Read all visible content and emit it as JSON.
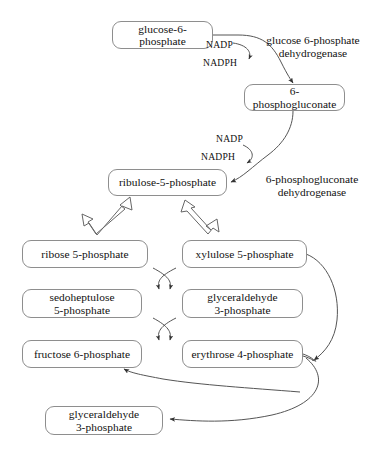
{
  "diagram": {
    "stroke_color": "#555555",
    "node_border_color": "#8e8e8e",
    "background": "#ffffff",
    "nodes": [
      {
        "id": "g6p",
        "label": "glucose-6-phosphate"
      },
      {
        "id": "pg6",
        "label": "6-phosphogluconate"
      },
      {
        "id": "ru5p",
        "label": "ribulose-5-phosphate"
      },
      {
        "id": "r5p",
        "label": "ribose 5-phosphate"
      },
      {
        "id": "xu5p",
        "label": "xylulose 5-phosphate"
      },
      {
        "id": "s7p",
        "label": "sedoheptulose\n5-phosphate"
      },
      {
        "id": "g3p_mid",
        "label": "glyceraldehyde\n3-phosphate"
      },
      {
        "id": "f6p",
        "label": "fructose 6-phosphate"
      },
      {
        "id": "e4p",
        "label": "erythrose 4-phosphate"
      },
      {
        "id": "g3p_bot",
        "label": "glyceraldehyde\n3-phosphate"
      }
    ],
    "enzymes": [
      {
        "id": "g6pdh",
        "label": "glucose 6-phosphate\ndehydrogenase"
      },
      {
        "id": "pgdh",
        "label": "6-phosphogluconate\ndehydrogenase"
      }
    ],
    "cofactors": [
      {
        "id": "nadp1",
        "label": "NADP"
      },
      {
        "id": "nadph1",
        "label": "NADPH"
      },
      {
        "id": "nadp2",
        "label": "NADP"
      },
      {
        "id": "nadph2",
        "label": "NADPH"
      }
    ],
    "edges": [
      {
        "id": "g6p-to-pg6",
        "from": "glucose-6-phosphate",
        "to": "6-phosphogluconate",
        "style": "curved-arrow"
      },
      {
        "id": "pg6-to-ru5p",
        "from": "6-phosphogluconate",
        "to": "ribulose-5-phosphate",
        "style": "curved-arrow"
      },
      {
        "id": "ru5p-to-r5p",
        "from": "ribulose-5-phosphate",
        "to": "ribose 5-phosphate",
        "style": "hollow-double-arrow"
      },
      {
        "id": "ru5p-to-xu5p",
        "from": "ribulose-5-phosphate",
        "to": "xylulose 5-phosphate",
        "style": "hollow-double-arrow"
      },
      {
        "id": "transketolase-1",
        "from": "ribose 5-phosphate / xylulose 5-phosphate",
        "to": "sedoheptulose 5-phosphate / glyceraldehyde 3-phosphate",
        "style": "crossing-arcs"
      },
      {
        "id": "transaldolase-1",
        "from": "sedoheptulose 5-phosphate / glyceraldehyde 3-phosphate",
        "to": "fructose 6-phosphate / erythrose 4-phosphate",
        "style": "crossing-arcs"
      },
      {
        "id": "xu5p-to-e4p-loop",
        "from": "xylulose 5-phosphate",
        "to": "erythrose 4-phosphate",
        "style": "curved-arrow"
      },
      {
        "id": "e4p-to-g3p-bot",
        "from": "erythrose 4-phosphate",
        "to": "glyceraldehyde 3-phosphate",
        "style": "curved-arrow"
      },
      {
        "id": "g3p-bot-to-f6p",
        "from": "glyceraldehyde 3-phosphate",
        "to": "fructose 6-phosphate",
        "style": "curved-arrow"
      }
    ]
  }
}
